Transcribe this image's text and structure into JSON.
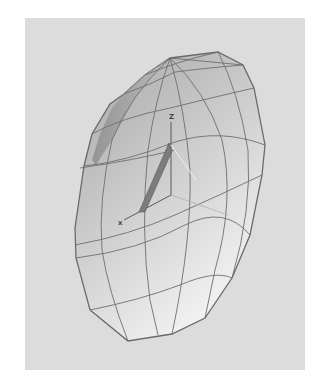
{
  "figure": {
    "axes": {
      "z_label": "Z",
      "x_label": "x"
    },
    "colors": {
      "background": "#ffffff",
      "panel": "#dcdcdc",
      "mesh_fill_dark": "#a9a9a9",
      "mesh_fill_light": "#f2f2f2",
      "mesh_line": "#6e6e6e",
      "axis_line": "#5a5a5a",
      "highlight_bar": "#7c7c7c"
    }
  }
}
